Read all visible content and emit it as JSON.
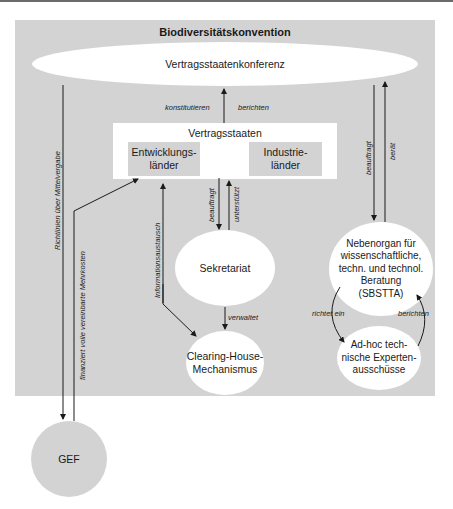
{
  "diagram": {
    "title": "Biodiversitätskonvention",
    "nodes": {
      "cop": "Vertragsstaatenkonferenz",
      "parties": {
        "title": "Vertragsstaaten",
        "developing": "Entwicklungs-\nländer",
        "industrial": "Industrie-\nländer"
      },
      "secretariat": "Sekretariat",
      "chm": "Clearing-House-\nMechanismus",
      "sbstta": "Nebenorgan für\nwissenschaftliche,\ntechn. und technol.\nBeratung\n(SBSTTA)",
      "adhoc": "Ad-hoc tech-\nnische Experten-\nausschüsse",
      "gef": "GEF"
    },
    "edges": {
      "constitute": "konstitutieren",
      "report_parties": "berichten",
      "guidelines": "Richtlinien über Mittelvergabe",
      "finances": "finanziert volle vereinbarte Mehrkosten",
      "info_exchange": "Informationsaustausch",
      "commissions_sec": "beauftragt",
      "supports": "unterstützt",
      "administers": "verwaltet",
      "commissions_sbstta": "beauftragt",
      "advises": "berät",
      "establishes": "richtet ein",
      "report_adhoc": "berichten"
    }
  }
}
